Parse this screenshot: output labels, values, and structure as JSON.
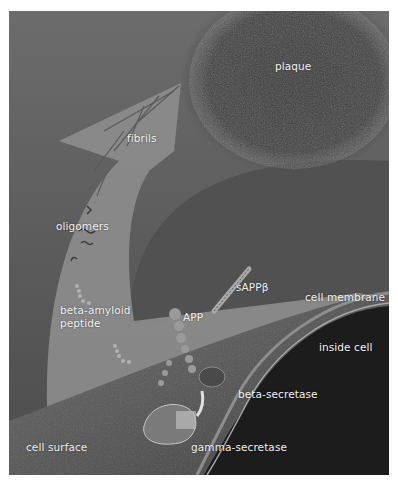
{
  "figure": {
    "colors": {
      "background_top": "#6a6a6a",
      "background_bottom": "#4a4a4a",
      "arrow": "#8e8e8e",
      "plaque": "#3e3e3e",
      "inside_cell": "#1e1e1e",
      "cell_surface": "#5a5a5a",
      "membrane": "#9a9a9a",
      "label_text": "#f2f2f2"
    },
    "labels": {
      "plaque": "plaque",
      "fibrils": "fibrils",
      "oligomers": "oligomers",
      "sappb": "sAPPβ",
      "cell_membrane": "cell membrane",
      "beta_amyloid_line1": "beta-amyloid",
      "beta_amyloid_line2": "peptide",
      "app": "APP",
      "inside_cell": "inside cell",
      "beta_secretase": "beta-secretase",
      "cell_surface": "cell surface",
      "gamma_secretase": "gamma-secretase"
    }
  }
}
